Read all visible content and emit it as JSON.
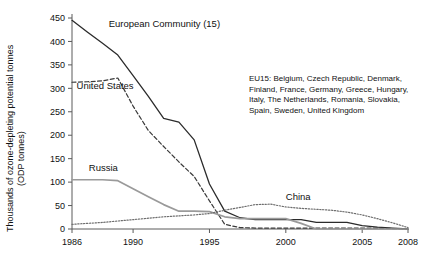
{
  "chart_data": {
    "type": "line",
    "title": "",
    "xlabel": "",
    "ylabel": "Thousands of ozone-depleting potential tonnes",
    "ylabel_line2": "(ODP tonnes)",
    "xlim": [
      1986,
      2008
    ],
    "ylim": [
      0,
      450
    ],
    "ytick_step": 50,
    "grid": false,
    "legend_position": "inline-annotations",
    "yticks": [
      "0",
      "50",
      "100",
      "150",
      "200",
      "250",
      "300",
      "350",
      "400",
      "450"
    ],
    "xticks": [
      "1986",
      "1990",
      "1995",
      "2000",
      "2005",
      "2008"
    ],
    "x": [
      1986,
      1987,
      1988,
      1989,
      1990,
      1991,
      1992,
      1993,
      1994,
      1995,
      1996,
      1997,
      1998,
      1999,
      2000,
      2001,
      2002,
      2003,
      2004,
      2005,
      2006,
      2007,
      2008
    ],
    "series": [
      {
        "name": "European Community (15)",
        "style": "solid",
        "color": "#2b2b2b",
        "label_x": 1988.4,
        "label_y": 430,
        "values": [
          445,
          420,
          396,
          371,
          327,
          283,
          236,
          228,
          190,
          96,
          38,
          24,
          20,
          20,
          20,
          20,
          14,
          14,
          14,
          7,
          4,
          2,
          0
        ]
      },
      {
        "name": "United States",
        "style": "dashed",
        "color": "#3a3a3a",
        "label_x": 1986.3,
        "label_y": 298,
        "values": [
          313,
          314,
          316,
          322,
          262,
          210,
          176,
          143,
          112,
          60,
          10,
          3,
          2,
          2,
          2,
          2,
          2,
          2,
          2,
          2,
          2,
          1,
          0
        ]
      },
      {
        "name": "Russia",
        "style": "solid-gray",
        "color": "#9a9a9a",
        "label_x": 1987.1,
        "label_y": 123,
        "values": [
          105,
          105,
          105,
          103,
          86,
          69,
          52,
          38,
          38,
          37,
          26,
          22,
          22,
          22,
          22,
          12,
          0,
          0,
          0,
          0,
          0,
          0,
          0
        ]
      },
      {
        "name": "China",
        "style": "dotted",
        "color": "#6e6e6e",
        "label_x": 2000.0,
        "label_y": 62,
        "values": [
          10,
          12,
          14,
          17,
          20,
          23,
          26,
          28,
          30,
          33,
          40,
          46,
          52,
          53,
          47,
          44,
          42,
          40,
          36,
          30,
          22,
          13,
          3
        ]
      }
    ],
    "annotation": {
      "id": "eu15-note",
      "lines": [
        "EU15: Belgium, Czech Republic, Denmark,",
        "Finland, France, Germany, Greece, Hungary,",
        "Italy, The Netherlands, Romania, Slovakia,",
        "Spain, Sweden, United Kingdom"
      ],
      "x": 249,
      "y": 81
    }
  }
}
